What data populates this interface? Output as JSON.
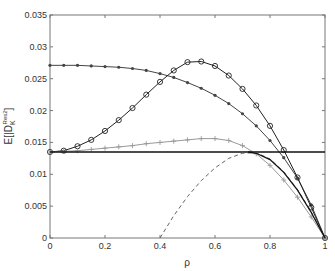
{
  "chart_data": {
    "type": "line",
    "title": "",
    "xlabel": "ρ",
    "ylabel": "E[|D_K^{Res}|²]",
    "ylabel_parts": {
      "base": "E[|D",
      "sub": "K",
      "sup": "Res",
      "tail": "|",
      "pow": "2",
      "close": "]"
    },
    "xlim": [
      0,
      1
    ],
    "ylim": [
      0,
      0.035
    ],
    "xticks": [
      0,
      0.2,
      0.4,
      0.6,
      0.8,
      1
    ],
    "xtick_labels": [
      "0",
      "0.2",
      "0.4",
      "0.6",
      "0.8",
      "1"
    ],
    "yticks": [
      0,
      0.005,
      0.01,
      0.015,
      0.02,
      0.025,
      0.03,
      0.035
    ],
    "ytick_labels": [
      "0",
      "0.005",
      "0.01",
      "0.015",
      "0.02",
      "0.025",
      "0.03",
      "0.035"
    ],
    "grid": false,
    "legend": "none",
    "x": [
      0,
      0.05,
      0.1,
      0.15,
      0.2,
      0.25,
      0.3,
      0.35,
      0.4,
      0.45,
      0.5,
      0.55,
      0.6,
      0.65,
      0.7,
      0.75,
      0.8,
      0.85,
      0.9,
      0.95,
      1
    ],
    "series": [
      {
        "name": "asterisk-series",
        "marker": "asterisk",
        "color": "#444444",
        "style": "solid",
        "values": [
          0.0271,
          0.0271,
          0.0271,
          0.027,
          0.0269,
          0.0268,
          0.0266,
          0.0263,
          0.0258,
          0.0252,
          0.0244,
          0.0235,
          0.0224,
          0.0211,
          0.0195,
          0.0176,
          0.0153,
          0.0126,
          0.0094,
          0.0052,
          0
        ]
      },
      {
        "name": "circle-series",
        "marker": "circle",
        "color": "#222222",
        "style": "solid",
        "values": [
          0.0135,
          0.0137,
          0.0144,
          0.0154,
          0.0168,
          0.0185,
          0.0204,
          0.0225,
          0.0245,
          0.0263,
          0.0276,
          0.0277,
          0.027,
          0.0255,
          0.0234,
          0.0208,
          0.0176,
          0.0138,
          0.0095,
          0.0048,
          0
        ]
      },
      {
        "name": "plus-series",
        "marker": "plus",
        "color": "#999999",
        "style": "solid",
        "values": [
          0.0135,
          0.0136,
          0.0137,
          0.0139,
          0.0141,
          0.0143,
          0.0145,
          0.0148,
          0.015,
          0.0152,
          0.0154,
          0.0156,
          0.0156,
          0.0153,
          0.0145,
          0.0132,
          0.0114,
          0.0091,
          0.0064,
          0.0033,
          0
        ]
      },
      {
        "name": "horizontal-reference",
        "marker": "none",
        "color": "#111111",
        "style": "solid",
        "values": [
          0.0135,
          0.0135,
          0.0135,
          0.0135,
          0.0135,
          0.0135,
          0.0135,
          0.0135,
          0.0135,
          0.0135,
          0.0135,
          0.0135,
          0.0135,
          0.0135,
          0.0135,
          0.0135,
          0.0135,
          0.0135,
          0.0135,
          0.0135,
          0.0135
        ]
      },
      {
        "name": "dashed-series",
        "marker": "none",
        "color": "#666666",
        "style": "dashed",
        "x": [
          0.4,
          0.45,
          0.5,
          0.55,
          0.6,
          0.65,
          0.7,
          0.75,
          0.8,
          0.85,
          0.9,
          0.95,
          1
        ],
        "values": [
          0,
          0.0035,
          0.0065,
          0.009,
          0.011,
          0.0125,
          0.0133,
          0.0134,
          0.0124,
          0.0104,
          0.0076,
          0.0041,
          0
        ]
      },
      {
        "name": "solid-tail-series",
        "marker": "none",
        "color": "#111111",
        "style": "solid",
        "x": [
          0.72,
          0.75,
          0.8,
          0.85,
          0.9,
          0.95,
          1
        ],
        "values": [
          0.0135,
          0.0133,
          0.0123,
          0.0103,
          0.0075,
          0.004,
          0
        ]
      }
    ]
  }
}
